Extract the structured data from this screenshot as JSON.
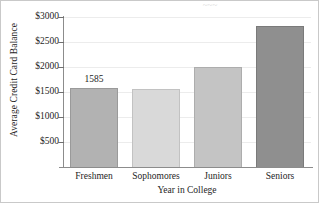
{
  "chart_data": {
    "type": "bar",
    "title": "",
    "xlabel": "Year in College",
    "ylabel": "Average Credit Card Balance",
    "categories": [
      "Freshmen",
      "Sophomores",
      "Juniors",
      "Seniors"
    ],
    "values": [
      1585,
      1565,
      1995,
      2820
    ],
    "value_labels": [
      "1585",
      "",
      "",
      ""
    ],
    "ytick_labels": [
      "$3000",
      "$2500",
      "$2000",
      "$1500",
      "$1000",
      "$500"
    ],
    "ytick_values": [
      3000,
      2500,
      2000,
      1500,
      1000,
      500
    ],
    "ylim": [
      0,
      3100
    ],
    "grid": "horizontal",
    "legend": "none",
    "bar_colors": [
      "#b2b2b2",
      "#d9d9d9",
      "#c4c4c4",
      "#8f8f8f"
    ],
    "bar_edge_colors": [
      "#9a9a9a",
      "#c2c2c2",
      "#adadad",
      "#7a7a7a"
    ],
    "axis_color": "#8c8c8c",
    "grid_color": "#ececec"
  },
  "figure": {
    "frame_color": "#c9c9c9",
    "background": "#ffffff",
    "cropped_title_fragment": "~~~"
  }
}
